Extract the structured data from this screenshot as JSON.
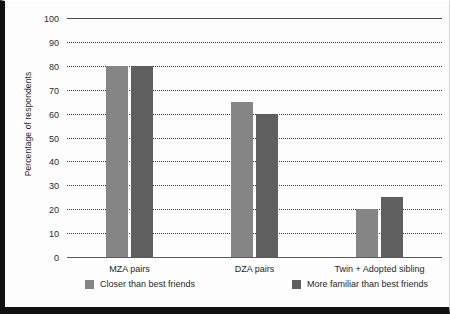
{
  "chart_data": {
    "type": "bar",
    "title": "",
    "xlabel": "",
    "ylabel": "Percentage of respondents",
    "categories": [
      "MZA pairs",
      "DZA pairs",
      "Twin + Adopted sibling"
    ],
    "series": [
      {
        "name": "Closer than best friends",
        "color": "#858585",
        "values": [
          80,
          65,
          20
        ]
      },
      {
        "name": "More familiar than best friends",
        "color": "#5f5f5f",
        "values": [
          80,
          60,
          25
        ]
      }
    ],
    "ylim": [
      0,
      100
    ],
    "ytick_step": 10,
    "yticks": [
      "100",
      "90",
      "80",
      "70",
      "60",
      "50",
      "40",
      "30",
      "20",
      "10",
      "0"
    ],
    "grid": "horizontal-dotted",
    "legend_position": "bottom"
  }
}
